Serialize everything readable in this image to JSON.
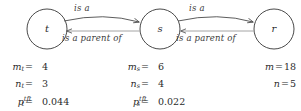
{
  "diagram": {
    "type": "directed-graph-with-statistics",
    "nodes": [
      {
        "id": "t",
        "label": "t",
        "cx": 47,
        "cy": 29,
        "r": 20
      },
      {
        "id": "s",
        "label": "s",
        "cx": 160,
        "cy": 29,
        "r": 20
      },
      {
        "id": "r",
        "label": "r",
        "cx": 274,
        "cy": 29,
        "r": 20
      }
    ],
    "edges": [
      {
        "from": "t",
        "to": "s",
        "label": "is a",
        "position": "above"
      },
      {
        "from": "s",
        "to": "t",
        "label": "is a parent of",
        "position": "below"
      },
      {
        "from": "s",
        "to": "r",
        "label": "is a",
        "position": "above"
      },
      {
        "from": "r",
        "to": "s",
        "label": "is a parent of",
        "position": "below"
      }
    ],
    "edge_labels": {
      "top_left": "is a",
      "bottom_left": "is a parent of",
      "top_right": "is a",
      "bottom_right": "is a parent of"
    },
    "stroke_color": "#4a4a4a",
    "text_color": "#2b2b2b"
  },
  "stats": {
    "column_t": [
      {
        "symbol": "m",
        "subscript": "t",
        "superscript": "",
        "equals": "=",
        "value": "4"
      },
      {
        "symbol": "n",
        "subscript": "t",
        "superscript": "",
        "equals": "=",
        "value": "3"
      },
      {
        "symbol": "p",
        "subscript": "t",
        "superscript": "tft",
        "equals": "=",
        "value": "0.044"
      }
    ],
    "column_s": [
      {
        "symbol": "m",
        "subscript": "s",
        "superscript": "",
        "equals": "=",
        "value": "6"
      },
      {
        "symbol": "n",
        "subscript": "s",
        "superscript": "",
        "equals": "=",
        "value": "4"
      },
      {
        "symbol": "p",
        "subscript": "s",
        "superscript": "tft",
        "equals": "=",
        "value": "0.022"
      }
    ],
    "column_totals": [
      {
        "symbol": "m",
        "subscript": "",
        "superscript": "",
        "equals": "=",
        "value": "18"
      },
      {
        "symbol": "n",
        "subscript": "",
        "superscript": "",
        "equals": "=",
        "value": "5"
      }
    ]
  }
}
